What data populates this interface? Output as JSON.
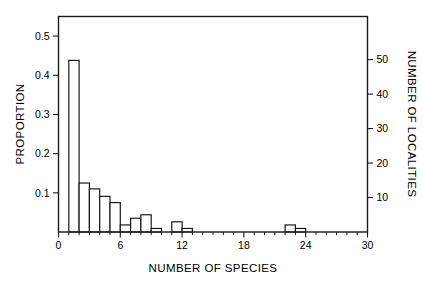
{
  "chart_data": {
    "type": "bar",
    "title": "",
    "subtitle": "",
    "xlabel": "NUMBER OF SPECIES",
    "ylabel": "PROPORTION",
    "y2label": "NUMBER OF LOCALITIES",
    "grid": false,
    "legend": false,
    "legend_position": "none",
    "bin_width": 1,
    "xlim": [
      0,
      30
    ],
    "ylim": [
      0,
      0.55
    ],
    "y2lim": [
      0,
      62.5
    ],
    "xticks": [
      0,
      6,
      12,
      18,
      24,
      30
    ],
    "xtick_labels": [
      "0",
      "6",
      "12",
      "18",
      "24",
      "30"
    ],
    "xticks_minor": [
      1,
      2,
      3,
      4,
      5,
      7,
      8,
      9,
      10,
      11,
      13,
      14,
      15,
      16,
      17,
      19,
      20,
      21,
      22,
      23,
      25,
      26,
      27,
      28,
      29
    ],
    "yticks": [
      0.1,
      0.2,
      0.3,
      0.4,
      0.5
    ],
    "ytick_labels": [
      "0.1",
      "0.2",
      "0.3",
      "0.4",
      "0.5"
    ],
    "y2ticks": [
      10,
      20,
      30,
      40,
      50
    ],
    "y2tick_labels": [
      "10",
      "20",
      "30",
      "40",
      "50"
    ],
    "categories": [
      1,
      2,
      3,
      4,
      5,
      6,
      7,
      8,
      9,
      10,
      11,
      12,
      13,
      14,
      15,
      16,
      17,
      18,
      19,
      20,
      21,
      22,
      23,
      24
    ],
    "values": [
      0.438,
      0.125,
      0.11,
      0.091,
      0.075,
      0.018,
      0.035,
      0.044,
      0.009,
      0.0,
      0.026,
      0.009,
      0.0,
      0.0,
      0.0,
      0.0,
      0.0,
      0.0,
      0.0,
      0.0,
      0.0,
      0.018,
      0.009,
      0.0
    ],
    "counts": [
      50,
      14,
      12.5,
      10.5,
      8.5,
      2,
      4,
      5,
      1,
      0,
      3,
      1,
      0,
      0,
      0,
      0,
      0,
      0,
      0,
      0,
      0,
      2,
      1,
      0
    ],
    "bars": [
      {
        "x0": 1,
        "x1": 2,
        "value": 0.438,
        "count": 50
      },
      {
        "x0": 2,
        "x1": 3,
        "value": 0.125,
        "count": 14
      },
      {
        "x0": 3,
        "x1": 4,
        "value": 0.11,
        "count": 12.5
      },
      {
        "x0": 4,
        "x1": 5,
        "value": 0.091,
        "count": 10.5
      },
      {
        "x0": 5,
        "x1": 6,
        "value": 0.075,
        "count": 8.5
      },
      {
        "x0": 6,
        "x1": 7,
        "value": 0.018,
        "count": 2
      },
      {
        "x0": 7,
        "x1": 8,
        "value": 0.035,
        "count": 4
      },
      {
        "x0": 8,
        "x1": 9,
        "value": 0.044,
        "count": 5
      },
      {
        "x0": 9,
        "x1": 10,
        "value": 0.009,
        "count": 1
      },
      {
        "x0": 11,
        "x1": 12,
        "value": 0.026,
        "count": 3
      },
      {
        "x0": 12,
        "x1": 13,
        "value": 0.009,
        "count": 1
      },
      {
        "x0": 22,
        "x1": 23,
        "value": 0.018,
        "count": 2
      },
      {
        "x0": 23,
        "x1": 24,
        "value": 0.009,
        "count": 1
      }
    ],
    "colors": {
      "bar_fill": "#ffffff",
      "bar_stroke": "#1a1a1a",
      "axis": "#1a1a1a",
      "background": "#ffffff"
    }
  }
}
